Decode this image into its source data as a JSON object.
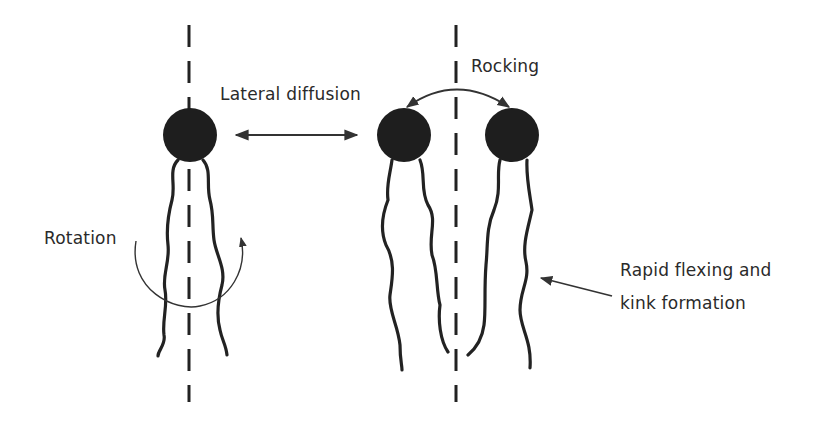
{
  "diagram": {
    "labels": {
      "lateral_diffusion": "Lateral diffusion",
      "rocking": "Rocking",
      "rotation": "Rotation",
      "flexing_line1": "Rapid flexing and",
      "flexing_line2": "kink formation"
    },
    "molecules": [
      {
        "id": "rotating-lipid",
        "head_center": [
          190,
          135
        ]
      },
      {
        "id": "rocking-lipid-left",
        "head_center": [
          404,
          135
        ]
      },
      {
        "id": "rocking-lipid-right",
        "head_center": [
          512,
          135
        ]
      }
    ],
    "colors": {
      "ink": "#222222",
      "head": "#1e1e1e",
      "background": "#ffffff"
    }
  }
}
